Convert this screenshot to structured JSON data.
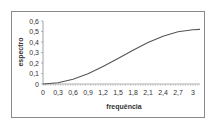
{
  "chart_data": {
    "type": "line",
    "title": "",
    "xlabel": "frequência",
    "ylabel": "espectro",
    "x_ticks": [
      "0",
      "0,3",
      "0,6",
      "0,9",
      "1,2",
      "1,5",
      "1,8",
      "2,1",
      "2,4",
      "2,7",
      "3"
    ],
    "y_ticks": [
      "0",
      "0,1",
      "0,2",
      "0,3",
      "0,4",
      "0,5",
      "0,6"
    ],
    "xlim": [
      0,
      3.14
    ],
    "ylim": [
      0,
      0.6
    ],
    "grid": false,
    "legend": null,
    "series": [
      {
        "name": "espectro",
        "color": "#555555",
        "x": [
          0,
          0.3,
          0.6,
          0.9,
          1.2,
          1.5,
          1.8,
          2.1,
          2.4,
          2.7,
          3.0,
          3.14
        ],
        "values": [
          0.0,
          0.012,
          0.046,
          0.098,
          0.166,
          0.242,
          0.321,
          0.394,
          0.455,
          0.497,
          0.517,
          0.52
        ]
      }
    ]
  }
}
